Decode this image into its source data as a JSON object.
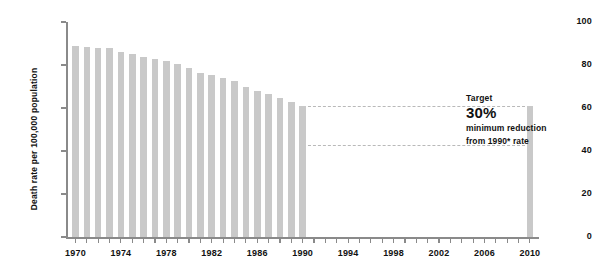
{
  "chart_data": {
    "type": "bar",
    "title": "",
    "xlabel": "",
    "ylabel": "Death rate per 100,000 population",
    "ylim": [
      0,
      100
    ],
    "xlim": [
      1969.3,
      2010.8
    ],
    "grid": false,
    "legend": null,
    "categories": [
      "1970",
      "1971",
      "1972",
      "1973",
      "1974",
      "1975",
      "1976",
      "1977",
      "1978",
      "1979",
      "1980",
      "1981",
      "1982",
      "1983",
      "1984",
      "1985",
      "1986",
      "1987",
      "1988",
      "1989",
      "1990",
      "2010"
    ],
    "values": [
      89.0,
      88.5,
      88.0,
      87.8,
      86.0,
      85.2,
      83.5,
      83.0,
      82.0,
      80.5,
      78.5,
      76.5,
      75.5,
      74.0,
      72.5,
      70.0,
      68.0,
      66.5,
      64.5,
      63.0,
      61.0,
      61.0
    ],
    "series": [
      {
        "name": "Death rate",
        "values": [
          89.0,
          88.5,
          88.0,
          87.8,
          86.0,
          85.2,
          83.5,
          83.0,
          82.0,
          80.5,
          78.5,
          76.5,
          75.5,
          74.0,
          72.5,
          70.0,
          68.0,
          66.5,
          64.5,
          63.0,
          61.0,
          61.0
        ]
      }
    ],
    "ytick_labels": [
      "0",
      "20",
      "40",
      "60",
      "80",
      "100"
    ],
    "ytick_values": [
      0,
      20,
      40,
      60,
      80,
      100
    ],
    "xtick_labels": [
      "1970",
      "1974",
      "1978",
      "1982",
      "1986",
      "1990",
      "1994",
      "1998",
      "2002",
      "2006",
      "2010"
    ],
    "xtick_values": [
      1970,
      1974,
      1978,
      1982,
      1986,
      1990,
      1994,
      1998,
      2002,
      2006,
      2010
    ],
    "xtick_minor_values": [
      1970,
      1971,
      1972,
      1973,
      1974,
      1975,
      1976,
      1977,
      1978,
      1979,
      1980,
      1981,
      1982,
      1983,
      1984,
      1985,
      1986,
      1987,
      1988,
      1989,
      1990,
      1991,
      1992,
      1993,
      1994,
      1995,
      1996,
      1997,
      1998,
      1999,
      2000,
      2001,
      2002,
      2003,
      2004,
      2005,
      2006,
      2007,
      2008,
      2009,
      2010
    ],
    "reference_lines": [
      {
        "name": "1990-rate-line",
        "y": 61.0,
        "x_from": 1990,
        "x_to": 2010,
        "style": "dashed"
      },
      {
        "name": "target-rate-line",
        "y": 42.7,
        "x_from": 1990,
        "x_to": 2010,
        "style": "dashed"
      }
    ],
    "annotations": [
      {
        "name": "target-callout",
        "title": "Target",
        "value": "30%",
        "line1": "minimum reduction",
        "line2": "from 1990* rate"
      }
    ],
    "colors": {
      "bar": "#c9c9c9",
      "axis": "#8a8a8a",
      "dashed_line": "#b9b9b9",
      "text": "#111111",
      "background": "#ffffff"
    }
  }
}
